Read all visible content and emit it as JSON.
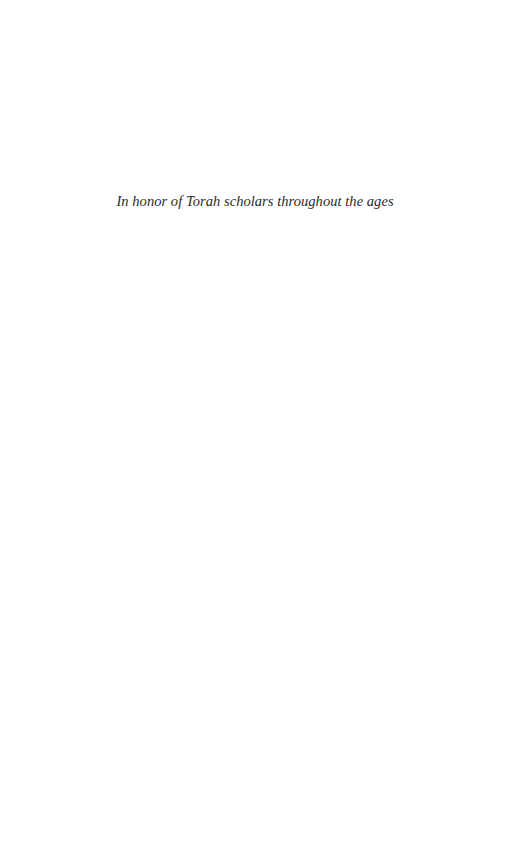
{
  "page": {
    "type": "dedication",
    "background": "#ffffff",
    "dedication_text": "In honor of Torah scholars throughout the ages",
    "text_color": "#2a2a2a"
  }
}
